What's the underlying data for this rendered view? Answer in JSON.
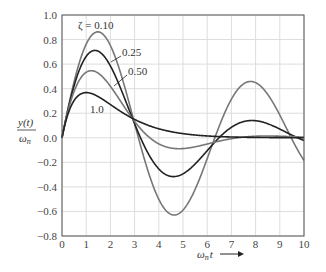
{
  "chart_data": {
    "type": "line",
    "title": "",
    "xlabel": "ω_n t",
    "ylabel": "y(t)/ω_n",
    "xlim": [
      0,
      10
    ],
    "ylim": [
      -0.8,
      1.0
    ],
    "x_ticks": [
      "0",
      "1",
      "2",
      "3",
      "4",
      "5",
      "6",
      "7",
      "8",
      "9",
      "10"
    ],
    "y_ticks": [
      "1.0",
      "0.8",
      "0.6",
      "0.4",
      "0.2",
      "0.0",
      "−0.2",
      "−0.4",
      "−0.6",
      "−0.8"
    ],
    "grid": true,
    "series": [
      {
        "name": "ζ = 0.10",
        "zeta": 0.1,
        "color": "#777777"
      },
      {
        "name": "0.25",
        "zeta": 0.25,
        "color": "#222222"
      },
      {
        "name": "0.50",
        "zeta": 0.5,
        "color": "#777777"
      },
      {
        "name": "1.0",
        "zeta": 1.0,
        "color": "#222222"
      }
    ],
    "annotations": [
      "ζ = 0.10",
      "0.25",
      "0.50",
      "1.0"
    ]
  },
  "labels": {
    "ylabel_num": "y(t)",
    "ylabel_den": "ω",
    "ylabel_den_sub": "n",
    "xlabel_main": "ω",
    "xlabel_sub": "n",
    "xlabel_t": "t",
    "z010": "ζ = 0.10",
    "z025": "0.25",
    "z050": "0.50",
    "z100": "1.0"
  }
}
